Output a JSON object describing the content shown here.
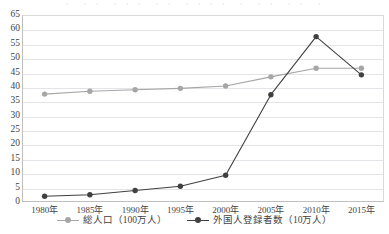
{
  "title_fragment": "・ ・・ ・・・ ・・ ・・・・ ・ ・・ ・・ ・",
  "colors": {
    "series_total_population": "#a6a6a6",
    "series_registered_foreigners": "#404040",
    "gridline": "#e4e4e8",
    "axis": "#bfbfbf",
    "text": "#3f3f3f"
  },
  "legend": {
    "position": "bottom-center",
    "items": [
      {
        "label": "総人口（100万人）",
        "color": "#a6a6a6"
      },
      {
        "label": "外国人登録者数（10万人）",
        "color": "#404040"
      }
    ]
  },
  "chart_data": {
    "type": "line",
    "title": "",
    "xlabel": "",
    "ylabel": "",
    "categories": [
      "1980年",
      "1985年",
      "1990年",
      "1995年",
      "2000年",
      "2005年",
      "2010年",
      "2015年"
    ],
    "ylim": [
      0,
      65
    ],
    "ytick_step": 5,
    "yticks": [
      0,
      5,
      10,
      15,
      20,
      25,
      30,
      35,
      40,
      45,
      50,
      55,
      60,
      65
    ],
    "ytick_labels": [
      "0",
      "5",
      "10",
      "15",
      "20",
      "25",
      "30",
      "35",
      "40",
      "45",
      "50",
      "55",
      "60",
      "65"
    ],
    "grid": true,
    "legend": "bottom",
    "series": [
      {
        "name": "総人口（100万人）",
        "color": "#a6a6a6",
        "marker": "circle",
        "values": [
          37.5,
          38.5,
          39.0,
          39.5,
          40.3,
          43.5,
          46.5,
          46.5
        ]
      },
      {
        "name": "外国人登録者数（10万人）",
        "color": "#404040",
        "marker": "circle",
        "values": [
          2.0,
          2.5,
          4.0,
          5.5,
          9.3,
          37.3,
          57.5,
          44.2
        ]
      }
    ]
  }
}
